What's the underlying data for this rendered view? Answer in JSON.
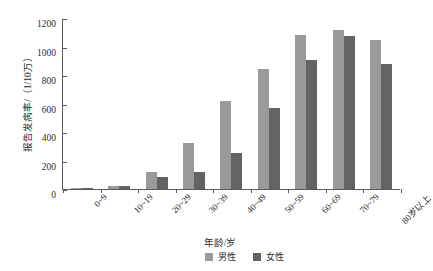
{
  "chart_data": {
    "type": "bar",
    "title": "",
    "xlabel": "年龄/岁",
    "ylabel": "报告发病率/（1/10万）",
    "ylim": [
      0,
      1200
    ],
    "yticks": [
      0,
      200,
      400,
      600,
      800,
      1000,
      1200
    ],
    "grid": false,
    "legend_position": "bottom",
    "categories": [
      "0~9",
      "10~19",
      "20~29",
      "30~39",
      "40~49",
      "50~59",
      "60~69",
      "70~79",
      "80岁以上"
    ],
    "series": [
      {
        "name": "男性",
        "color": "#9a9a9a",
        "values": [
          8,
          22,
          118,
          320,
          615,
          845,
          1080,
          1115,
          1045
        ]
      },
      {
        "name": "女性",
        "color": "#636363",
        "values": [
          6,
          18,
          85,
          120,
          250,
          570,
          905,
          1075,
          875
        ]
      }
    ]
  },
  "legend": {
    "items": [
      {
        "label": "男性"
      },
      {
        "label": "女性"
      }
    ]
  }
}
